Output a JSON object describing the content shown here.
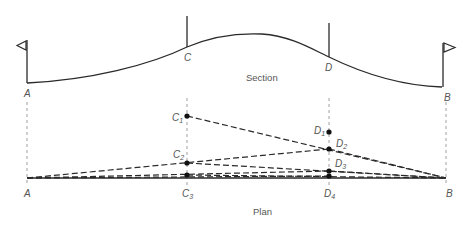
{
  "section": {
    "caption": "Section",
    "points": {
      "A": {
        "label": "A"
      },
      "B": {
        "label": "B"
      },
      "C": {
        "label": "C"
      },
      "D": {
        "label": "D"
      }
    }
  },
  "plan": {
    "caption": "Plan",
    "end_labels": {
      "A": "A",
      "B": "B"
    },
    "C_points": [
      {
        "base": "C",
        "sub": "1"
      },
      {
        "base": "C",
        "sub": "2"
      },
      {
        "base": "C",
        "sub": "3"
      }
    ],
    "D_points": [
      {
        "base": "D",
        "sub": "1"
      },
      {
        "base": "D",
        "sub": "2"
      },
      {
        "base": "D",
        "sub": "3"
      },
      {
        "base": "D",
        "sub": "4"
      }
    ]
  }
}
